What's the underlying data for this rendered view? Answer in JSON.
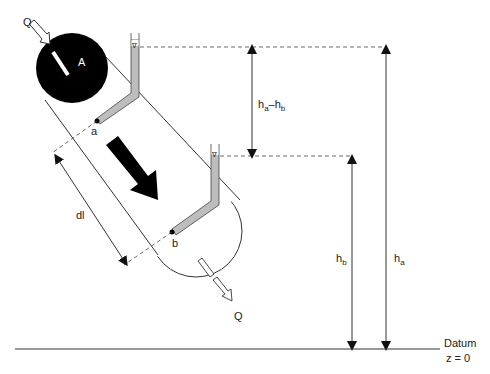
{
  "diagram": {
    "type": "darcy-law-apparatus",
    "labels": {
      "inflow": "Q",
      "outflow": "Q",
      "area": "A",
      "point_a": "a",
      "point_b": "b",
      "length": "dl",
      "head_diff_main_a": "h",
      "head_diff_sub_a": "a",
      "head_diff_dash": "–",
      "head_diff_main_b": "h",
      "head_diff_sub_b": "b",
      "head_b_main": "h",
      "head_b_sub": "b",
      "head_a_main": "h",
      "head_a_sub": "a",
      "datum_line1": "Datum",
      "datum_line2": "z = 0",
      "water_level_symbol": "∇"
    },
    "colors": {
      "stroke": "#333333",
      "fill_dark": "#000000",
      "piezometer_fill": "#bdbdbd",
      "background": "#ffffff"
    }
  }
}
